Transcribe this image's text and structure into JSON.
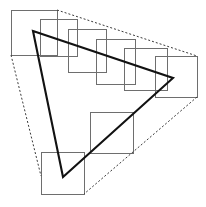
{
  "figure": {
    "canvas": {
      "width": 206,
      "height": 207,
      "background": "#ffffff"
    },
    "colors": {
      "square_stroke": "#6e6e6e",
      "hull_stroke": "#3a3a3a",
      "triangle_stroke": "#121212",
      "background": "#ffffff"
    }
  },
  "squares": {
    "stroke_width": 1,
    "count": 8,
    "items": [
      {
        "name": "square-1",
        "x": 11,
        "y": 10,
        "width": 46,
        "height": 45
      },
      {
        "name": "square-2",
        "x": 40,
        "y": 19,
        "width": 37,
        "height": 37
      },
      {
        "name": "square-3",
        "x": 68,
        "y": 29,
        "width": 38,
        "height": 43
      },
      {
        "name": "square-4",
        "x": 96,
        "y": 39,
        "width": 39,
        "height": 45
      },
      {
        "name": "square-5",
        "x": 124,
        "y": 48,
        "width": 43,
        "height": 42
      },
      {
        "name": "square-6",
        "x": 155,
        "y": 56,
        "width": 42,
        "height": 41
      },
      {
        "name": "square-7",
        "x": 90,
        "y": 112,
        "width": 43,
        "height": 41
      },
      {
        "name": "square-8",
        "x": 41,
        "y": 152,
        "width": 43,
        "height": 42
      }
    ]
  },
  "triangle": {
    "name": "solid-triangle",
    "stroke_width": 2.1,
    "closed": true,
    "vertices": [
      {
        "label": "top-left-vertex",
        "x": 33,
        "y": 31
      },
      {
        "label": "right-vertex",
        "x": 173,
        "y": 78
      },
      {
        "label": "bottom-vertex",
        "x": 63,
        "y": 177
      }
    ],
    "path": "M 33 31 L 173 78 L 63 177 Z"
  },
  "hull": {
    "name": "dashed-hull",
    "stroke_width": 1,
    "dash_pattern": "2 2",
    "edges": [
      {
        "name": "hull-edge-top",
        "from": {
          "x": 57,
          "y": 10
        },
        "to": {
          "x": 197,
          "y": 56
        },
        "path": "M 57 10 L 197 56"
      },
      {
        "name": "hull-edge-right",
        "from": {
          "x": 197,
          "y": 97
        },
        "to": {
          "x": 84,
          "y": 194
        },
        "path": "M 197 97 L 84 194"
      },
      {
        "name": "hull-edge-left",
        "from": {
          "x": 11,
          "y": 55
        },
        "to": {
          "x": 41,
          "y": 176
        },
        "path": "M 11 55 L 41 176"
      }
    ]
  }
}
